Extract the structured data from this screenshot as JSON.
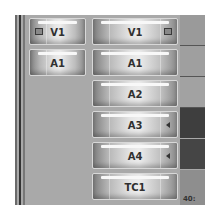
{
  "track_patch_panel": {
    "source_tracks": [
      {
        "label": "V1",
        "icon": "lock-icon"
      },
      {
        "label": "A1"
      }
    ],
    "record_tracks": [
      {
        "label": "V1",
        "icon": "lock-icon"
      },
      {
        "label": "A1"
      },
      {
        "label": "A2"
      },
      {
        "label": "A3",
        "icon": "triangle-left-icon"
      },
      {
        "label": "A4",
        "icon": "triangle-left-icon"
      },
      {
        "label": "TC1"
      }
    ],
    "timecode_fragment": "40:"
  },
  "colors": {
    "panel_bg": "#a9a9a9",
    "dark_strip": "#3c3c3c",
    "mid_strip": "#8c8c8c"
  }
}
